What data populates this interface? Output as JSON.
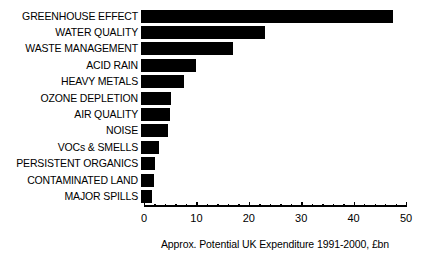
{
  "chart_data": {
    "type": "bar",
    "orientation": "horizontal",
    "title": "",
    "xlabel": "Approx. Potential UK Expenditure 1991-2000, £bn",
    "ylabel": "",
    "xlim": [
      0,
      50
    ],
    "xticks": [
      0,
      10,
      20,
      30,
      40,
      50
    ],
    "xtick_labels": [
      "0",
      "10",
      "20",
      "30",
      "40",
      "50"
    ],
    "minor_tick_interval": 2,
    "grid": false,
    "legend": false,
    "bar_color": "#000000",
    "background_color": "#ffffff",
    "categories": [
      "GREENHOUSE EFFECT",
      "WATER QUALITY",
      "WASTE MANAGEMENT",
      "ACID RAIN",
      "HEAVY METALS",
      "OZONE DEPLETION",
      "AIR QUALITY",
      "NOISE",
      "VOCs & SMELLS",
      "PERSISTENT ORGANICS",
      "CONTAMINATED LAND",
      "MAJOR SPILLS"
    ],
    "values": [
      48,
      23.7,
      17.5,
      10.5,
      8.3,
      5.8,
      5.6,
      5.2,
      3.5,
      2.7,
      2.5,
      2.1
    ]
  }
}
